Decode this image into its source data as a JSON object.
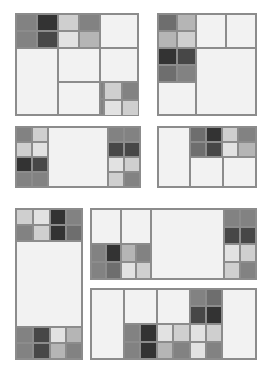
{
  "figure": {
    "canvas": {
      "width": 266,
      "height": 369,
      "background": "#ffffff"
    },
    "palette": {
      "tone0": "#f2f2f2",
      "tone1": "#e2e2e2",
      "tone2": "#cfcfcf",
      "tone3": "#b5b5b5",
      "tone4": "#9a9a9a",
      "tone5": "#828282",
      "tone6": "#6e6e6e",
      "tone7": "#5a5a5a",
      "tone8": "#474747",
      "tone9": "#333333",
      "border": "#8c8c8c",
      "panel_fill": "#f2f2f2"
    }
  },
  "chart_data": {
    "type": "treemap",
    "xlabel": "",
    "ylabel": "",
    "legend": [],
    "grid": false,
    "panel_count": 7,
    "panels": [
      {
        "id": "panel-1",
        "name": "top-left-square",
        "rect": {
          "x": 15,
          "y": 13,
          "w": 124,
          "h": 103
        },
        "cells": [
          {
            "x": 0,
            "y": 0,
            "w": 21,
            "h": 17,
            "tone": "t5"
          },
          {
            "x": 21,
            "y": 0,
            "w": 21,
            "h": 17,
            "tone": "t9"
          },
          {
            "x": 42,
            "y": 0,
            "w": 21,
            "h": 17,
            "tone": "t2"
          },
          {
            "x": 63,
            "y": 0,
            "w": 21,
            "h": 17,
            "tone": "t5"
          },
          {
            "x": 0,
            "y": 17,
            "w": 21,
            "h": 17,
            "tone": "t5"
          },
          {
            "x": 21,
            "y": 17,
            "w": 21,
            "h": 17,
            "tone": "t8"
          },
          {
            "x": 42,
            "y": 17,
            "w": 21,
            "h": 17,
            "tone": "t1"
          },
          {
            "x": 63,
            "y": 17,
            "w": 21,
            "h": 17,
            "tone": "t3"
          },
          {
            "x": 84,
            "y": 0,
            "w": 38,
            "h": 34,
            "tone": "t0"
          },
          {
            "x": 0,
            "y": 34,
            "w": 42,
            "h": 67,
            "tone": "t0"
          },
          {
            "x": 42,
            "y": 34,
            "w": 42,
            "h": 34,
            "tone": "t0"
          },
          {
            "x": 84,
            "y": 34,
            "w": 38,
            "h": 34,
            "tone": "t0"
          },
          {
            "x": 42,
            "y": 68,
            "w": 42,
            "h": 33,
            "tone": "t0"
          },
          {
            "x": 84,
            "y": 68,
            "w": 19,
            "h": 17,
            "tone": "t5"
          },
          {
            "x": 103,
            "y": 68,
            "w": 19,
            "h": 17,
            "tone": "t9"
          },
          {
            "x": 84,
            "y": 85,
            "w": 19,
            "h": 16,
            "tone": "t5"
          },
          {
            "x": 103,
            "y": 85,
            "w": 19,
            "h": 16,
            "tone": "t8"
          }
        ]
      },
      {
        "id": "panel-1b",
        "name": "top-left-square-extension",
        "rect": {
          "x": 103,
          "y": 81,
          "w": 36,
          "h": 35
        },
        "cells": [
          {
            "x": 0,
            "y": 0,
            "w": 18,
            "h": 18,
            "tone": "t2"
          },
          {
            "x": 18,
            "y": 0,
            "w": 18,
            "h": 18,
            "tone": "t5"
          },
          {
            "x": 0,
            "y": 18,
            "w": 18,
            "h": 17,
            "tone": "t1"
          },
          {
            "x": 18,
            "y": 18,
            "w": 18,
            "h": 17,
            "tone": "t2"
          }
        ]
      },
      {
        "id": "panel-2",
        "name": "top-right-square",
        "rect": {
          "x": 157,
          "y": 13,
          "w": 100,
          "h": 103
        },
        "cells": [
          {
            "x": 0,
            "y": 0,
            "w": 19,
            "h": 17,
            "tone": "t6"
          },
          {
            "x": 19,
            "y": 0,
            "w": 19,
            "h": 17,
            "tone": "t3"
          },
          {
            "x": 0,
            "y": 17,
            "w": 19,
            "h": 17,
            "tone": "t3"
          },
          {
            "x": 19,
            "y": 17,
            "w": 19,
            "h": 17,
            "tone": "t2"
          },
          {
            "x": 38,
            "y": 0,
            "w": 30,
            "h": 34,
            "tone": "t0"
          },
          {
            "x": 68,
            "y": 0,
            "w": 30,
            "h": 34,
            "tone": "t0"
          },
          {
            "x": 0,
            "y": 34,
            "w": 19,
            "h": 17,
            "tone": "t9"
          },
          {
            "x": 19,
            "y": 34,
            "w": 19,
            "h": 17,
            "tone": "t8"
          },
          {
            "x": 0,
            "y": 51,
            "w": 19,
            "h": 17,
            "tone": "t6"
          },
          {
            "x": 19,
            "y": 51,
            "w": 19,
            "h": 17,
            "tone": "t5"
          },
          {
            "x": 38,
            "y": 34,
            "w": 60,
            "h": 67,
            "tone": "t0"
          },
          {
            "x": 0,
            "y": 68,
            "w": 38,
            "h": 33,
            "tone": "t0"
          }
        ]
      },
      {
        "id": "panel-3",
        "name": "middle-left-wide",
        "rect": {
          "x": 15,
          "y": 126,
          "w": 126,
          "h": 62
        },
        "cells": [
          {
            "x": 0,
            "y": 0,
            "w": 16,
            "h": 15,
            "tone": "t5"
          },
          {
            "x": 16,
            "y": 0,
            "w": 16,
            "h": 15,
            "tone": "t2"
          },
          {
            "x": 0,
            "y": 15,
            "w": 16,
            "h": 15,
            "tone": "t2"
          },
          {
            "x": 16,
            "y": 15,
            "w": 16,
            "h": 15,
            "tone": "t1"
          },
          {
            "x": 0,
            "y": 30,
            "w": 16,
            "h": 15,
            "tone": "t9"
          },
          {
            "x": 16,
            "y": 30,
            "w": 16,
            "h": 15,
            "tone": "t8"
          },
          {
            "x": 0,
            "y": 45,
            "w": 16,
            "h": 15,
            "tone": "t5"
          },
          {
            "x": 16,
            "y": 45,
            "w": 16,
            "h": 15,
            "tone": "t5"
          },
          {
            "x": 32,
            "y": 0,
            "w": 60,
            "h": 60,
            "tone": "t0"
          },
          {
            "x": 92,
            "y": 0,
            "w": 16,
            "h": 15,
            "tone": "t5"
          },
          {
            "x": 108,
            "y": 0,
            "w": 16,
            "h": 15,
            "tone": "t5"
          },
          {
            "x": 92,
            "y": 15,
            "w": 16,
            "h": 15,
            "tone": "t8"
          },
          {
            "x": 108,
            "y": 15,
            "w": 16,
            "h": 15,
            "tone": "t8"
          },
          {
            "x": 92,
            "y": 30,
            "w": 16,
            "h": 15,
            "tone": "t1"
          },
          {
            "x": 108,
            "y": 30,
            "w": 16,
            "h": 15,
            "tone": "t2"
          },
          {
            "x": 92,
            "y": 45,
            "w": 16,
            "h": 15,
            "tone": "t2"
          },
          {
            "x": 108,
            "y": 45,
            "w": 16,
            "h": 15,
            "tone": "t5"
          }
        ]
      },
      {
        "id": "panel-4",
        "name": "middle-right-wide",
        "rect": {
          "x": 157,
          "y": 126,
          "w": 100,
          "h": 62
        },
        "cells": [
          {
            "x": 0,
            "y": 0,
            "w": 32,
            "h": 60,
            "tone": "t0"
          },
          {
            "x": 32,
            "y": 0,
            "w": 16,
            "h": 15,
            "tone": "t6"
          },
          {
            "x": 48,
            "y": 0,
            "w": 16,
            "h": 15,
            "tone": "t9"
          },
          {
            "x": 64,
            "y": 0,
            "w": 16,
            "h": 15,
            "tone": "t2"
          },
          {
            "x": 80,
            "y": 0,
            "w": 18,
            "h": 15,
            "tone": "t5"
          },
          {
            "x": 32,
            "y": 15,
            "w": 16,
            "h": 15,
            "tone": "t6"
          },
          {
            "x": 48,
            "y": 15,
            "w": 16,
            "h": 15,
            "tone": "t8"
          },
          {
            "x": 64,
            "y": 15,
            "w": 16,
            "h": 15,
            "tone": "t1"
          },
          {
            "x": 80,
            "y": 15,
            "w": 18,
            "h": 15,
            "tone": "t3"
          },
          {
            "x": 32,
            "y": 30,
            "w": 33,
            "h": 30,
            "tone": "t0"
          },
          {
            "x": 65,
            "y": 30,
            "w": 33,
            "h": 30,
            "tone": "t0"
          }
        ]
      },
      {
        "id": "panel-5",
        "name": "bottom-left-tall",
        "rect": {
          "x": 15,
          "y": 208,
          "w": 68,
          "h": 152
        },
        "cells": [
          {
            "x": 0,
            "y": 0,
            "w": 17,
            "h": 16,
            "tone": "t2"
          },
          {
            "x": 17,
            "y": 0,
            "w": 17,
            "h": 16,
            "tone": "t1"
          },
          {
            "x": 34,
            "y": 0,
            "w": 16,
            "h": 16,
            "tone": "t9"
          },
          {
            "x": 50,
            "y": 0,
            "w": 16,
            "h": 16,
            "tone": "t5"
          },
          {
            "x": 0,
            "y": 16,
            "w": 17,
            "h": 16,
            "tone": "t5"
          },
          {
            "x": 17,
            "y": 16,
            "w": 17,
            "h": 16,
            "tone": "t2"
          },
          {
            "x": 34,
            "y": 16,
            "w": 16,
            "h": 16,
            "tone": "t9"
          },
          {
            "x": 50,
            "y": 16,
            "w": 16,
            "h": 16,
            "tone": "t6"
          },
          {
            "x": 0,
            "y": 32,
            "w": 66,
            "h": 86,
            "tone": "t0"
          },
          {
            "x": 0,
            "y": 118,
            "w": 17,
            "h": 16,
            "tone": "t5"
          },
          {
            "x": 17,
            "y": 118,
            "w": 17,
            "h": 16,
            "tone": "t8"
          },
          {
            "x": 34,
            "y": 118,
            "w": 16,
            "h": 16,
            "tone": "t1"
          },
          {
            "x": 50,
            "y": 118,
            "w": 16,
            "h": 16,
            "tone": "t3"
          },
          {
            "x": 0,
            "y": 134,
            "w": 17,
            "h": 16,
            "tone": "t5"
          },
          {
            "x": 17,
            "y": 134,
            "w": 17,
            "h": 16,
            "tone": "t8"
          },
          {
            "x": 34,
            "y": 134,
            "w": 16,
            "h": 16,
            "tone": "t3"
          },
          {
            "x": 50,
            "y": 134,
            "w": 16,
            "h": 16,
            "tone": "t5"
          }
        ]
      },
      {
        "id": "panel-6",
        "name": "bottom-right-wide-upper",
        "rect": {
          "x": 90,
          "y": 208,
          "w": 167,
          "h": 72
        },
        "cells": [
          {
            "x": 0,
            "y": 0,
            "w": 30,
            "h": 35,
            "tone": "t0"
          },
          {
            "x": 30,
            "y": 0,
            "w": 30,
            "h": 35,
            "tone": "t0"
          },
          {
            "x": 60,
            "y": 0,
            "w": 73,
            "h": 70,
            "tone": "t0"
          },
          {
            "x": 0,
            "y": 35,
            "w": 15,
            "h": 18,
            "tone": "t5"
          },
          {
            "x": 15,
            "y": 35,
            "w": 15,
            "h": 18,
            "tone": "t9"
          },
          {
            "x": 30,
            "y": 35,
            "w": 15,
            "h": 18,
            "tone": "t3"
          },
          {
            "x": 45,
            "y": 35,
            "w": 15,
            "h": 18,
            "tone": "t5"
          },
          {
            "x": 0,
            "y": 53,
            "w": 15,
            "h": 17,
            "tone": "t5"
          },
          {
            "x": 15,
            "y": 53,
            "w": 15,
            "h": 17,
            "tone": "t6"
          },
          {
            "x": 30,
            "y": 53,
            "w": 15,
            "h": 17,
            "tone": "t1"
          },
          {
            "x": 45,
            "y": 53,
            "w": 15,
            "h": 17,
            "tone": "t2"
          },
          {
            "x": 133,
            "y": 0,
            "w": 16,
            "h": 18,
            "tone": "t5"
          },
          {
            "x": 149,
            "y": 0,
            "w": 16,
            "h": 18,
            "tone": "t5"
          },
          {
            "x": 133,
            "y": 18,
            "w": 16,
            "h": 17,
            "tone": "t8"
          },
          {
            "x": 149,
            "y": 18,
            "w": 16,
            "h": 17,
            "tone": "t8"
          },
          {
            "x": 133,
            "y": 35,
            "w": 16,
            "h": 18,
            "tone": "t1"
          },
          {
            "x": 149,
            "y": 35,
            "w": 16,
            "h": 18,
            "tone": "t2"
          },
          {
            "x": 133,
            "y": 53,
            "w": 16,
            "h": 17,
            "tone": "t2"
          },
          {
            "x": 149,
            "y": 53,
            "w": 16,
            "h": 17,
            "tone": "t5"
          }
        ]
      },
      {
        "id": "panel-7",
        "name": "bottom-right-wide-lower",
        "rect": {
          "x": 90,
          "y": 288,
          "w": 167,
          "h": 72
        },
        "cells": [
          {
            "x": 0,
            "y": 0,
            "w": 33,
            "h": 70,
            "tone": "t0"
          },
          {
            "x": 33,
            "y": 0,
            "w": 33,
            "h": 35,
            "tone": "t0"
          },
          {
            "x": 66,
            "y": 0,
            "w": 33,
            "h": 35,
            "tone": "t0"
          },
          {
            "x": 99,
            "y": 0,
            "w": 16,
            "h": 17,
            "tone": "t5"
          },
          {
            "x": 115,
            "y": 0,
            "w": 16,
            "h": 17,
            "tone": "t6"
          },
          {
            "x": 99,
            "y": 17,
            "w": 16,
            "h": 18,
            "tone": "t8"
          },
          {
            "x": 115,
            "y": 17,
            "w": 16,
            "h": 18,
            "tone": "t9"
          },
          {
            "x": 131,
            "y": 0,
            "w": 34,
            "h": 70,
            "tone": "t0"
          },
          {
            "x": 33,
            "y": 35,
            "w": 16,
            "h": 18,
            "tone": "t5"
          },
          {
            "x": 49,
            "y": 35,
            "w": 17,
            "h": 18,
            "tone": "t9"
          },
          {
            "x": 66,
            "y": 35,
            "w": 16,
            "h": 18,
            "tone": "t1"
          },
          {
            "x": 82,
            "y": 35,
            "w": 17,
            "h": 18,
            "tone": "t2"
          },
          {
            "x": 99,
            "y": 35,
            "w": 16,
            "h": 18,
            "tone": "t1"
          },
          {
            "x": 115,
            "y": 35,
            "w": 16,
            "h": 18,
            "tone": "t2"
          },
          {
            "x": 33,
            "y": 53,
            "w": 16,
            "h": 17,
            "tone": "t5"
          },
          {
            "x": 49,
            "y": 53,
            "w": 17,
            "h": 17,
            "tone": "t9"
          },
          {
            "x": 66,
            "y": 53,
            "w": 16,
            "h": 17,
            "tone": "t3"
          },
          {
            "x": 82,
            "y": 53,
            "w": 17,
            "h": 17,
            "tone": "t5"
          },
          {
            "x": 99,
            "y": 53,
            "w": 16,
            "h": 17,
            "tone": "t1"
          },
          {
            "x": 115,
            "y": 53,
            "w": 16,
            "h": 17,
            "tone": "t5"
          }
        ]
      }
    ]
  }
}
